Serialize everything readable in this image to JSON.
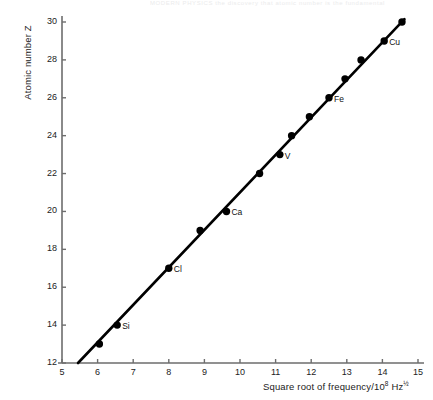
{
  "scan": {
    "header_text": "MODERN PHYSICS   the discovery that atomic number is the fundamental"
  },
  "chart_data": {
    "type": "scatter",
    "title": "",
    "xlabel": "Square root of frequency/10",
    "xlabel_exp": "8",
    "xlabel_unit": " Hz",
    "xlabel_unit_exp": "½",
    "ylabel": "Atomic number Z",
    "xlim": [
      5,
      15
    ],
    "ylim": [
      12,
      30
    ],
    "xticks": [
      5,
      6,
      7,
      8,
      9,
      10,
      11,
      12,
      13,
      14,
      15
    ],
    "xtick_labels": [
      "5",
      "6",
      "7",
      "8",
      "9",
      "10",
      "11",
      "12",
      "13",
      "14",
      "15"
    ],
    "yticks": [
      12,
      14,
      16,
      18,
      20,
      22,
      24,
      26,
      28,
      30
    ],
    "ytick_labels": [
      "12",
      "14",
      "16",
      "18",
      "20",
      "22",
      "24",
      "26",
      "28",
      "30"
    ],
    "grid": false,
    "legend": false,
    "series": [
      {
        "name": "Moseley K-alpha data",
        "marker": "filled-circle",
        "marker_color": "#000000",
        "points": [
          {
            "x": 6.05,
            "y": 13,
            "label": ""
          },
          {
            "x": 6.55,
            "y": 14,
            "label": "Si"
          },
          {
            "x": 8.0,
            "y": 17,
            "label": "Cl"
          },
          {
            "x": 8.88,
            "y": 19,
            "label": ""
          },
          {
            "x": 9.62,
            "y": 20,
            "label": "Ca"
          },
          {
            "x": 10.55,
            "y": 22,
            "label": ""
          },
          {
            "x": 11.12,
            "y": 23,
            "label": "V"
          },
          {
            "x": 11.45,
            "y": 24,
            "label": ""
          },
          {
            "x": 11.95,
            "y": 25,
            "label": ""
          },
          {
            "x": 12.5,
            "y": 26,
            "label": "Fe"
          },
          {
            "x": 12.95,
            "y": 27,
            "label": ""
          },
          {
            "x": 13.4,
            "y": 28,
            "label": ""
          },
          {
            "x": 14.05,
            "y": 29,
            "label": "Cu"
          },
          {
            "x": 14.55,
            "y": 30,
            "label": ""
          }
        ]
      }
    ],
    "fit_line": {
      "name": "best-fit straight line",
      "color": "#000000",
      "x_start": 5.45,
      "y_start": 12.0,
      "x_end": 14.62,
      "y_end": 30.15
    }
  }
}
